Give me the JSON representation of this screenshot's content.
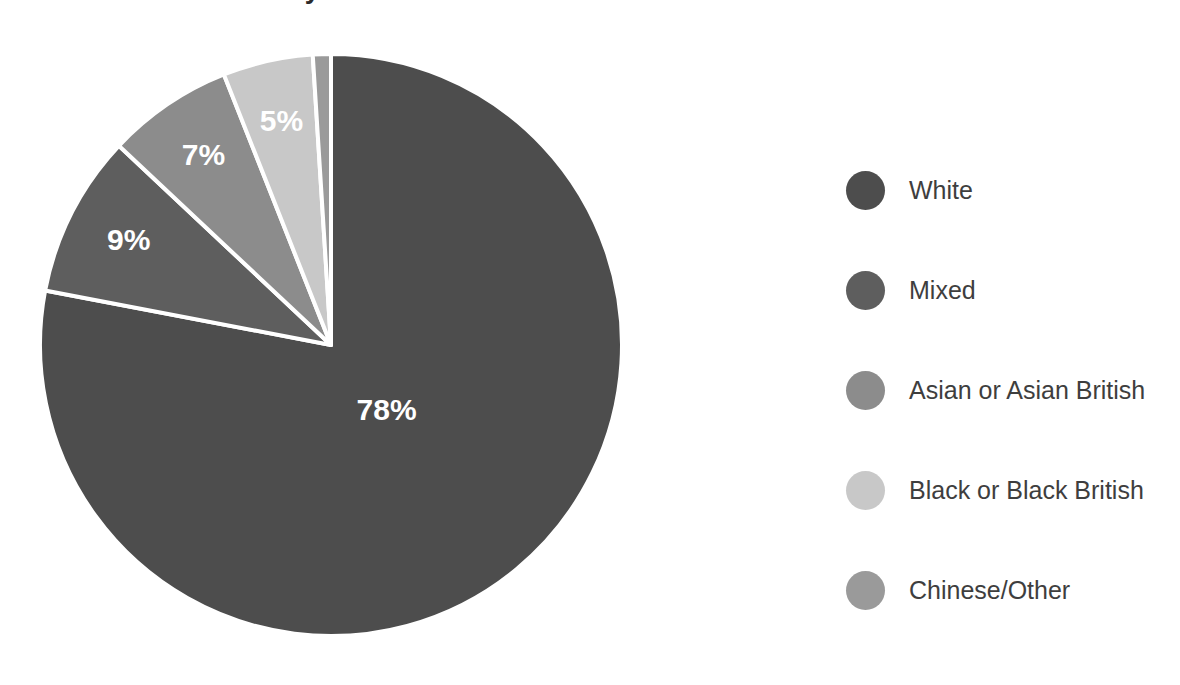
{
  "chart_data": {
    "type": "pie",
    "title": "Ethnicity of Workforce",
    "title_visible": false,
    "categories": [
      "White",
      "Mixed",
      "Asian or Asian British",
      "Black or Black British",
      "Chinese/Other"
    ],
    "values": [
      78,
      9,
      7,
      5,
      1
    ],
    "value_labels": [
      "78%",
      "9%",
      "7%",
      "5%",
      ""
    ],
    "colors": [
      "#4d4d4d",
      "#5e5e5e",
      "#8c8c8c",
      "#c8c8c8",
      "#9a9a9a"
    ],
    "xlabel": "",
    "ylabel": "",
    "legend_position": "right",
    "grid": false,
    "start_angle_deg": 0,
    "direction": "clockwise",
    "slice_border_color": "#ffffff",
    "label_text_color": "#ffffff",
    "background_color": "#ffffff"
  },
  "chart": {
    "title": "Ethnicity of Workforce",
    "slices": [
      {
        "label": "White",
        "percent_label": "78%",
        "value": 78,
        "color": "#4d4d4d"
      },
      {
        "label": "Mixed",
        "percent_label": "9%",
        "value": 9,
        "color": "#5e5e5e"
      },
      {
        "label": "Asian or Asian British",
        "percent_label": "7%",
        "value": 7,
        "color": "#8c8c8c"
      },
      {
        "label": "Black or Black British",
        "percent_label": "5%",
        "value": 5,
        "color": "#c8c8c8"
      },
      {
        "label": "Chinese/Other",
        "percent_label": "",
        "value": 1,
        "color": "#9a9a9a"
      }
    ]
  },
  "legend": {
    "items": [
      {
        "label": "White",
        "color": "#4d4d4d"
      },
      {
        "label": "Mixed",
        "color": "#5e5e5e"
      },
      {
        "label": "Asian or Asian British",
        "color": "#8c8c8c"
      },
      {
        "label": "Black or Black British",
        "color": "#c8c8c8"
      },
      {
        "label": "Chinese/Other",
        "color": "#9a9a9a"
      }
    ]
  }
}
